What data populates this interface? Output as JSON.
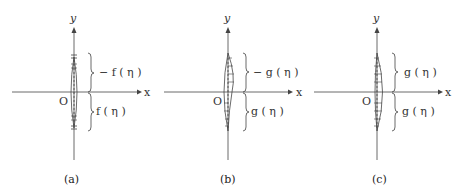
{
  "figure": {
    "panels": [
      {
        "id": "a",
        "caption": "(a)",
        "axis_x": "x",
        "axis_y": "y",
        "origin": "O",
        "upper_label": "− f ( η )",
        "lower_label": "f ( η )",
        "crack_shape": "symmetric"
      },
      {
        "id": "b",
        "caption": "(b)",
        "axis_x": "x",
        "axis_y": "y",
        "origin": "O",
        "upper_label": "− g ( η )",
        "lower_label": "g ( η )",
        "crack_shape": "antisymmetric"
      },
      {
        "id": "c",
        "caption": "(c)",
        "axis_x": "x",
        "axis_y": "y",
        "origin": "O",
        "upper_label": "g ( η )",
        "lower_label": "g ( η )",
        "crack_shape": "symmetric-shifted"
      }
    ],
    "colors": {
      "line": "#444444",
      "text": "#333333",
      "background": "#ffffff"
    }
  }
}
